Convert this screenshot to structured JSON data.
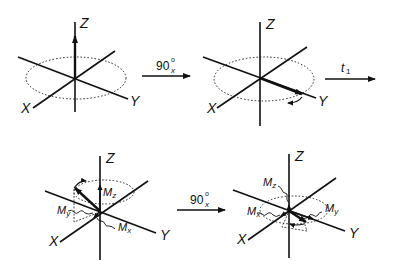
{
  "diagram": {
    "type": "NMR magnetization vector rotation sequence",
    "panels": [
      {
        "id": "top-left",
        "axes": {
          "z": "Z",
          "x": "X",
          "y": "Y"
        },
        "description": "Net magnetization along +Z at equilibrium"
      },
      {
        "id": "top-right",
        "axes": {
          "z": "Z",
          "x": "X",
          "y": "Y"
        },
        "description": "After 90x pulse, magnetization along Y precessing in XY plane"
      },
      {
        "id": "bottom-left",
        "axes": {
          "z": "Z",
          "x": "X",
          "y": "Y"
        },
        "components": {
          "mz": "M",
          "mz_sub": "z",
          "my": "M",
          "my_sub": "y",
          "mx": "M",
          "mx_sub": "x"
        },
        "description": "After delay t1, magnetization with components Mx, My, Mz"
      },
      {
        "id": "bottom-right",
        "axes": {
          "z": "Z",
          "x": "X",
          "y": "Y"
        },
        "components": {
          "mz": "M",
          "mz_sub": "z",
          "mx": "M",
          "mx_sub": "x",
          "my": "M",
          "my_sub": "y"
        },
        "description": "After second 90x pulse"
      }
    ],
    "arrows": [
      {
        "id": "pulse-1",
        "label": "90",
        "sup": "o",
        "sub": "x"
      },
      {
        "id": "delay",
        "label": "t",
        "sub": "1"
      },
      {
        "id": "pulse-2",
        "label": "90",
        "sup": "o",
        "sub": "x"
      }
    ],
    "colors": {
      "stroke": "#111111",
      "background": "#ffffff"
    }
  }
}
